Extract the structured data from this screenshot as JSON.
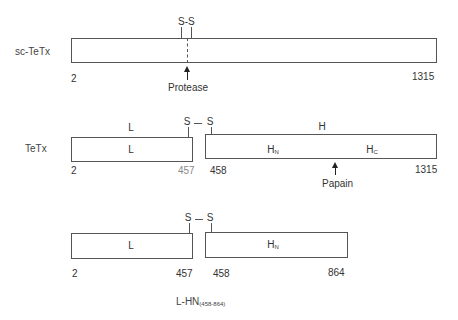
{
  "diagram": {
    "constructs": [
      {
        "id": "sc-tetx",
        "label": "sc-TeTx",
        "disulfide": "S-S",
        "cleavage_agent": "Protease",
        "start": "2",
        "end": "1315"
      },
      {
        "id": "tetx",
        "label": "TeTx",
        "chain_labels": {
          "light": "L",
          "heavy": "H"
        },
        "domains": {
          "light": "L",
          "hn_main": "H",
          "hn_sub": "N",
          "hc_main": "H",
          "hc_sub": "C"
        },
        "disulfide": {
          "left": "S",
          "bond": "—",
          "right": "S"
        },
        "cleavage_agent": "Papain",
        "positions": {
          "start": "2",
          "light_end": "457",
          "heavy_start": "458",
          "end": "1315"
        }
      },
      {
        "id": "l-hn",
        "domains": {
          "light": "L",
          "hn_main": "H",
          "hn_sub": "N"
        },
        "disulfide": {
          "left": "S",
          "bond": "—",
          "right": "S"
        },
        "positions": {
          "start": "2",
          "light_end": "457",
          "heavy_start": "458",
          "end": "864"
        },
        "caption": {
          "main": "L-HN",
          "sub": "(458-864)"
        }
      }
    ]
  }
}
